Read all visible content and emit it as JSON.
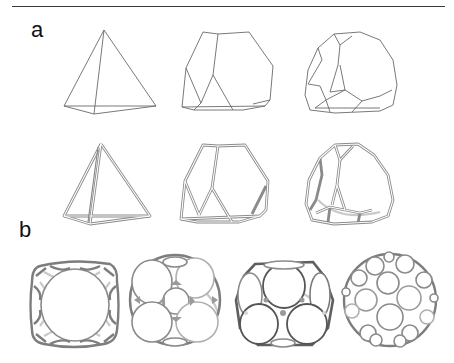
{
  "figure": {
    "panels": [
      {
        "label": "a",
        "rows": [
          {
            "style": "thin wireframe",
            "shapes": [
              "tetrahedron",
              "truncated tetrahedron",
              "higher-order truncated tetrahedron"
            ]
          },
          {
            "style": "double-strand wireframe",
            "shapes": [
              "tetrahedron",
              "truncated tetrahedron",
              "higher-order truncated tetrahedron"
            ]
          }
        ]
      },
      {
        "label": "b",
        "rows": [
          {
            "style": "rendered mesh",
            "shapes": [
              "truncated cube",
              "truncated cuboctahedron",
              "truncated octahedron",
              "truncated icosahedron"
            ]
          }
        ]
      }
    ],
    "colors": {
      "line": "#6a6a6a",
      "mesh_front": "#7d7d7d",
      "mesh_back": "#c9c9c9",
      "background": "#ffffff"
    }
  }
}
